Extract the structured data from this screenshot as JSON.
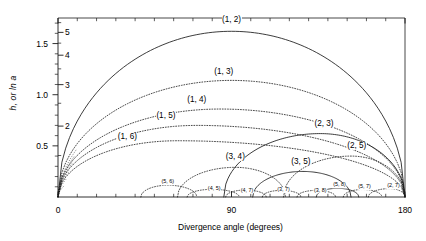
{
  "chart_data": {
    "type": "line",
    "title": "",
    "xlabel": "Divergence angle (degrees)",
    "ylabel": "h, or ln a",
    "xlim": [
      0,
      180
    ],
    "ylim": [
      0,
      1.75
    ],
    "grid": false,
    "legend": null,
    "x_ticks": [
      {
        "value": 0,
        "label": "0"
      },
      {
        "value": 90,
        "label": "90"
      },
      {
        "value": 180,
        "label": "180"
      }
    ],
    "x_minor_ticks": [
      10,
      20,
      30,
      40,
      50,
      60,
      70,
      80,
      100,
      110,
      120,
      130,
      140,
      150,
      160,
      170
    ],
    "y_ticks_outer": [
      {
        "value": 0.5,
        "label": "0.5"
      },
      {
        "value": 1.0,
        "label": "1.0"
      },
      {
        "value": 1.5,
        "label": "1.5"
      }
    ],
    "y_ticks_inner": [
      {
        "value": 0.6931,
        "label": "2"
      },
      {
        "value": 1.0986,
        "label": "3"
      },
      {
        "value": 1.3863,
        "label": "4"
      },
      {
        "value": 1.6094,
        "label": "5"
      }
    ],
    "y_minor_ticks_outer": [
      0.1,
      0.2,
      0.3,
      0.4,
      0.6,
      0.7,
      0.8,
      0.9,
      1.1,
      1.2,
      1.3,
      1.4,
      1.6,
      1.7
    ],
    "y_minor_ticks_inner": [
      0.4055,
      0.9163,
      1.2528,
      1.5041,
      1.7047
    ],
    "series": [
      {
        "name": "(1, 2)",
        "style": "solid",
        "x_start": 0,
        "x_end": 180,
        "peak_x": 90,
        "peak_y": 1.62,
        "label_x": 90,
        "label_y": 1.73,
        "label_size": "normal"
      },
      {
        "name": "(1, 3)",
        "style": "dotted",
        "x_start": 0,
        "x_end": 180,
        "peak_x": 90,
        "peak_y": 1.14,
        "label_x": 86,
        "label_y": 1.22,
        "label_size": "normal"
      },
      {
        "name": "(1, 4)",
        "style": "dotted",
        "x_start": 0,
        "x_end": 180,
        "peak_x": 84,
        "peak_y": 0.86,
        "label_x": 72,
        "label_y": 0.95,
        "label_size": "normal"
      },
      {
        "name": "(1, 5)",
        "style": "dotted",
        "x_start": 0,
        "x_end": 180,
        "peak_x": 72,
        "peak_y": 0.7,
        "label_x": 56,
        "label_y": 0.79,
        "label_size": "normal"
      },
      {
        "name": "(1, 6)",
        "style": "dotted",
        "x_start": 0,
        "x_end": 180,
        "peak_x": 62,
        "peak_y": 0.55,
        "label_x": 36,
        "label_y": 0.59,
        "label_size": "normal"
      },
      {
        "name": "(2, 3)",
        "style": "solid",
        "x_start": 86,
        "x_end": 180,
        "peak_x": 136,
        "peak_y": 0.62,
        "label_x": 138,
        "label_y": 0.71,
        "label_size": "normal"
      },
      {
        "name": "(2, 5)",
        "style": "dotted",
        "x_start": 117,
        "x_end": 180,
        "peak_x": 152,
        "peak_y": 0.4,
        "label_x": 155,
        "label_y": 0.5,
        "label_size": "normal"
      },
      {
        "name": "(3, 4)",
        "style": "dotted",
        "x_start": 62,
        "x_end": 118,
        "peak_x": 92,
        "peak_y": 0.29,
        "label_x": 92,
        "label_y": 0.39,
        "label_size": "normal"
      },
      {
        "name": "(3, 5)",
        "style": "solid",
        "x_start": 101,
        "x_end": 152,
        "peak_x": 127,
        "peak_y": 0.25,
        "label_x": 126,
        "label_y": 0.34,
        "label_size": "normal"
      },
      {
        "name": "(5, 6)",
        "style": "dotted",
        "x_start": 43,
        "x_end": 72,
        "peak_x": 57,
        "peak_y": 0.115,
        "label_x": 57,
        "label_y": 0.145,
        "label_size": "tiny"
      },
      {
        "name": "(4, 5)",
        "style": "dotted",
        "x_start": 67,
        "x_end": 94,
        "peak_x": 80,
        "peak_y": 0.075,
        "label_x": 81,
        "label_y": 0.075,
        "label_size": "tiny"
      },
      {
        "name": "(4, 7)",
        "style": "dotted",
        "x_start": 87,
        "x_end": 108,
        "peak_x": 97,
        "peak_y": 0.068,
        "label_x": 98,
        "label_y": 0.063,
        "label_size": "tiny"
      },
      {
        "name": "(3, 7)",
        "style": "dotted",
        "x_start": 106,
        "x_end": 126,
        "peak_x": 116,
        "peak_y": 0.065,
        "label_x": 117,
        "label_y": 0.065,
        "label_size": "tiny"
      },
      {
        "name": "(3, 8)",
        "style": "dotted",
        "x_start": 124,
        "x_end": 144,
        "peak_x": 134,
        "peak_y": 0.065,
        "label_x": 136,
        "label_y": 0.062,
        "label_size": "tiny"
      },
      {
        "name": "(5, 8)",
        "style": "solid",
        "x_start": 134,
        "x_end": 156,
        "peak_x": 145,
        "peak_y": 0.085,
        "label_x": 146,
        "label_y": 0.115,
        "label_size": "tiny"
      },
      {
        "name": "(5, 7)",
        "style": "dotted",
        "x_start": 148,
        "x_end": 168,
        "peak_x": 158,
        "peak_y": 0.073,
        "label_x": 159,
        "label_y": 0.095,
        "label_size": "tiny"
      },
      {
        "name": "(2, 7)",
        "style": "dotted",
        "x_start": 161,
        "x_end": 180,
        "peak_x": 172,
        "peak_y": 0.082,
        "label_x": 174,
        "label_y": 0.105,
        "label_size": "tiny"
      }
    ],
    "origin_fan": {
      "description": "family of dotted curves converging at origin",
      "count": 6
    }
  },
  "axis": {
    "y_label_text": "h, or ln a",
    "x_label_text": "Divergence angle (degrees)"
  }
}
